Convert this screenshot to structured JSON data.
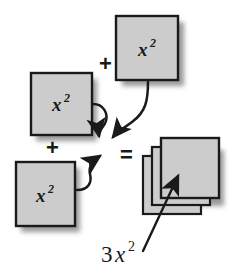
{
  "diagram": {
    "background_color": "#ffffff",
    "tile_fill_color": "#cccccc",
    "tile_stroke_color": "#1a1a1a",
    "shadow_color": "#9a9a9a",
    "ink_color": "#1a1a1a",
    "operators": {
      "plus_top_label": "+",
      "plus_bottom_label": "+",
      "equals_label": "="
    },
    "tiles": [
      {
        "id": "tile-top",
        "base": "x",
        "exponent": "2",
        "label": "x2"
      },
      {
        "id": "tile-middle",
        "base": "x",
        "exponent": "2",
        "label": "x2"
      },
      {
        "id": "tile-bottom",
        "base": "x",
        "exponent": "2",
        "label": "x2"
      }
    ],
    "result": {
      "stack_count": 3,
      "coefficient": "3",
      "base": "x",
      "exponent": "2",
      "label": "3x2"
    },
    "arrows": [
      {
        "id": "arrow-from-middle-tile",
        "style": "curved"
      },
      {
        "id": "arrow-from-top-tile",
        "style": "curved"
      },
      {
        "id": "arrow-from-bottom-tile",
        "style": "curved"
      },
      {
        "id": "arrow-to-result-stack",
        "style": "straight"
      }
    ]
  }
}
